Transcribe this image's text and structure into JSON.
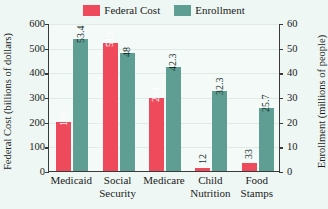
{
  "chart_data": {
    "type": "bar",
    "title": "",
    "subtitle": "",
    "categories": [
      "Medicaid",
      "Social Security",
      "Medicare",
      "Child Nutrition",
      "Food Stamps"
    ],
    "series": [
      {
        "name": "Federal Cost",
        "axis": "left",
        "color": "#ef4a5c",
        "values": [
          198,
          519,
          294,
          12,
          33
        ],
        "labels": [
          "198",
          "519",
          "294",
          "12",
          "33"
        ]
      },
      {
        "name": "Enrollment",
        "axis": "right",
        "color": "#5f9e92",
        "values": [
          53.4,
          48,
          42.3,
          32.3,
          25.7
        ],
        "labels": [
          "53.4",
          "48",
          "42.3",
          "32.3",
          "25.7"
        ]
      }
    ],
    "xlabel": "",
    "ylabel": "Federal Cost (billions of dollars)",
    "ylabel_right": "Enrollment (millions of people)",
    "ylim": [
      0,
      600
    ],
    "ylim_right": [
      0,
      60
    ],
    "yticks": [
      "0",
      "100",
      "200",
      "300",
      "400",
      "500",
      "600"
    ],
    "yticks_right": [
      "0",
      "10",
      "20",
      "30",
      "40",
      "50",
      "60"
    ],
    "grid": true,
    "legend_position": "top-center"
  },
  "legend": {
    "entries": [
      {
        "label": "Federal Cost",
        "color": "#ef4a5c",
        "swatch_name": "legend-swatch-federal-cost"
      },
      {
        "label": "Enrollment",
        "color": "#5f9e92",
        "swatch_name": "legend-swatch-enrollment"
      }
    ]
  },
  "axes": {
    "left_title": "Federal Cost (billions of dollars)",
    "right_title": "Enrollment (millions of people)"
  }
}
